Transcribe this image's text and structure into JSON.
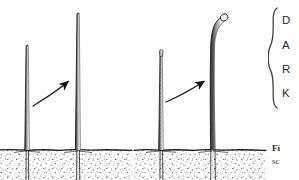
{
  "page": {
    "background_color": "#fdfdfc",
    "ink_color": "#2b2b2b",
    "width": 299,
    "height": 180
  },
  "figure": {
    "title_hidden": "plant shoot growth comparison diagram",
    "panels": [
      {
        "id": "panel-left",
        "label_hidden": "straight shoot elongation",
        "plants": [
          {
            "id": "left-panel-short-shoot",
            "description": "short straight shoot with pointed tip",
            "tip_style": "pointed",
            "stem_x": 27,
            "tip_y": 46,
            "soil_y": 150,
            "root_y": 180,
            "top_width": 2.6,
            "base_width": 4.6
          },
          {
            "id": "left-panel-tall-shoot",
            "description": "tall straight shoot with pointed tip",
            "tip_style": "pointed",
            "stem_x": 78,
            "tip_y": 14,
            "soil_y": 150,
            "root_y": 180,
            "top_width": 2.8,
            "base_width": 5.0
          }
        ],
        "arrow": {
          "id": "arrow-left",
          "from_x": 35,
          "from_y": 104,
          "ctrl_x": 54,
          "ctrl_y": 92,
          "to_x": 70,
          "to_y": 80
        },
        "soil": {
          "surface_y": 150,
          "stipple_color": "#4a4a4a"
        }
      },
      {
        "id": "panel-right",
        "label_hidden": "hooked shoot elongation",
        "plants": [
          {
            "id": "right-panel-short-shoot",
            "description": "short straight shoot with rounded bud tip",
            "tip_style": "bud",
            "stem_x": 161,
            "tip_y": 54,
            "soil_y": 150,
            "root_y": 180,
            "top_width": 2.8,
            "base_width": 4.8
          },
          {
            "id": "right-panel-hooked-shoot",
            "description": "tall shoot curving to the right ending in rounded bud",
            "tip_style": "hooked-bud",
            "stem_x": 212,
            "tip_y": 16,
            "soil_y": 150,
            "root_y": 180,
            "top_width": 3.0,
            "base_width": 5.0
          }
        ],
        "arrow": {
          "id": "arrow-right",
          "from_x": 168,
          "from_y": 100,
          "ctrl_x": 190,
          "ctrl_y": 88,
          "to_x": 207,
          "to_y": 80
        },
        "soil": {
          "surface_y": 150,
          "stipple_color": "#4a4a4a"
        }
      }
    ]
  },
  "brace": {
    "glyph": "{",
    "orientation": "left-curly",
    "labels": [
      {
        "text": "D"
      },
      {
        "text": "A"
      },
      {
        "text": "R"
      },
      {
        "text": "K"
      }
    ]
  },
  "caption": {
    "lead": "Fi",
    "body": "sc",
    "note_hidden": "caption text cropped at page edge"
  }
}
